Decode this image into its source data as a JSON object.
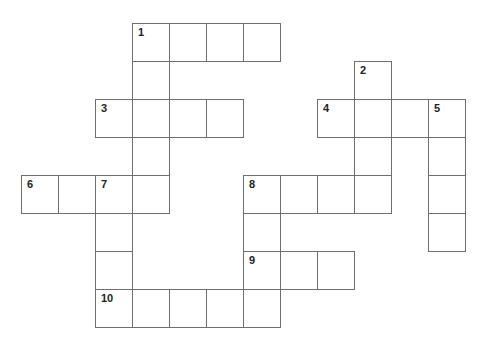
{
  "puzzle": {
    "type": "crossword",
    "cell_size": 37,
    "row_height": 38,
    "origin_x": 21,
    "origin_y": 23,
    "border_color": "#6e6e6e",
    "cells": [
      {
        "r": 0,
        "c": 3,
        "n": "1"
      },
      {
        "r": 0,
        "c": 4
      },
      {
        "r": 0,
        "c": 5
      },
      {
        "r": 0,
        "c": 6
      },
      {
        "r": 1,
        "c": 3
      },
      {
        "r": 1,
        "c": 9,
        "n": "2"
      },
      {
        "r": 2,
        "c": 2,
        "n": "3"
      },
      {
        "r": 2,
        "c": 3
      },
      {
        "r": 2,
        "c": 4
      },
      {
        "r": 2,
        "c": 5
      },
      {
        "r": 2,
        "c": 8,
        "n": "4"
      },
      {
        "r": 2,
        "c": 9
      },
      {
        "r": 2,
        "c": 10
      },
      {
        "r": 2,
        "c": 11,
        "n": "5"
      },
      {
        "r": 3,
        "c": 3
      },
      {
        "r": 3,
        "c": 9
      },
      {
        "r": 3,
        "c": 11
      },
      {
        "r": 4,
        "c": 0,
        "n": "6"
      },
      {
        "r": 4,
        "c": 1
      },
      {
        "r": 4,
        "c": 2,
        "n": "7"
      },
      {
        "r": 4,
        "c": 3
      },
      {
        "r": 4,
        "c": 6,
        "n": "8"
      },
      {
        "r": 4,
        "c": 7
      },
      {
        "r": 4,
        "c": 8
      },
      {
        "r": 4,
        "c": 9
      },
      {
        "r": 4,
        "c": 11
      },
      {
        "r": 5,
        "c": 2
      },
      {
        "r": 5,
        "c": 6
      },
      {
        "r": 5,
        "c": 11
      },
      {
        "r": 6,
        "c": 2
      },
      {
        "r": 6,
        "c": 6,
        "n": "9"
      },
      {
        "r": 6,
        "c": 7
      },
      {
        "r": 6,
        "c": 8
      },
      {
        "r": 7,
        "c": 2,
        "n": "10"
      },
      {
        "r": 7,
        "c": 3
      },
      {
        "r": 7,
        "c": 4
      },
      {
        "r": 7,
        "c": 5
      },
      {
        "r": 7,
        "c": 6
      }
    ],
    "clue_numbers": [
      "1",
      "2",
      "3",
      "4",
      "5",
      "6",
      "7",
      "8",
      "9",
      "10"
    ]
  }
}
